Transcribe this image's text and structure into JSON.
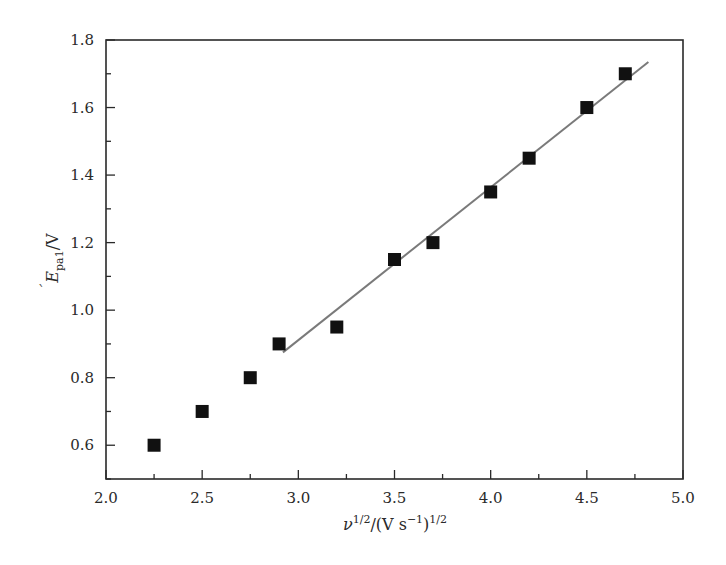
{
  "chart_data": {
    "type": "scatter",
    "title": "",
    "xlabel": "ν^1/2/(V s^-1)^1/2",
    "ylabel": "E_pa1/V",
    "xlabel_parts": {
      "base": "ν",
      "sup1": "1/2",
      "mid": "/(V s",
      "sup2": "−1",
      "close": ")",
      "sup3": "1/2"
    },
    "ylabel_parts": {
      "base": "E",
      "sub": "pa1",
      "unit": "/V"
    },
    "xlim": [
      2.0,
      5.0
    ],
    "ylim": [
      0.5,
      1.8
    ],
    "x_ticks": [
      "2.0",
      "2.5",
      "3.0",
      "3.5",
      "4.0",
      "4.5",
      "5.0"
    ],
    "y_ticks": [
      "0.6",
      "0.8",
      "1.0",
      "1.2",
      "1.4",
      "1.6",
      "1.8"
    ],
    "grid": false,
    "legend": null,
    "series": [
      {
        "name": "E_pa1",
        "marker": "filled-square",
        "color": "#111111",
        "x": [
          2.25,
          2.5,
          2.75,
          2.9,
          3.2,
          3.5,
          3.7,
          4.0,
          4.2,
          4.5,
          4.7
        ],
        "y": [
          0.6,
          0.7,
          0.8,
          0.9,
          0.95,
          1.15,
          1.2,
          1.35,
          1.45,
          1.6,
          1.7
        ]
      },
      {
        "name": "linear fit",
        "type": "line",
        "color": "#7a7a7a",
        "x": [
          2.92,
          4.82
        ],
        "y": [
          0.875,
          1.735
        ]
      }
    ]
  }
}
